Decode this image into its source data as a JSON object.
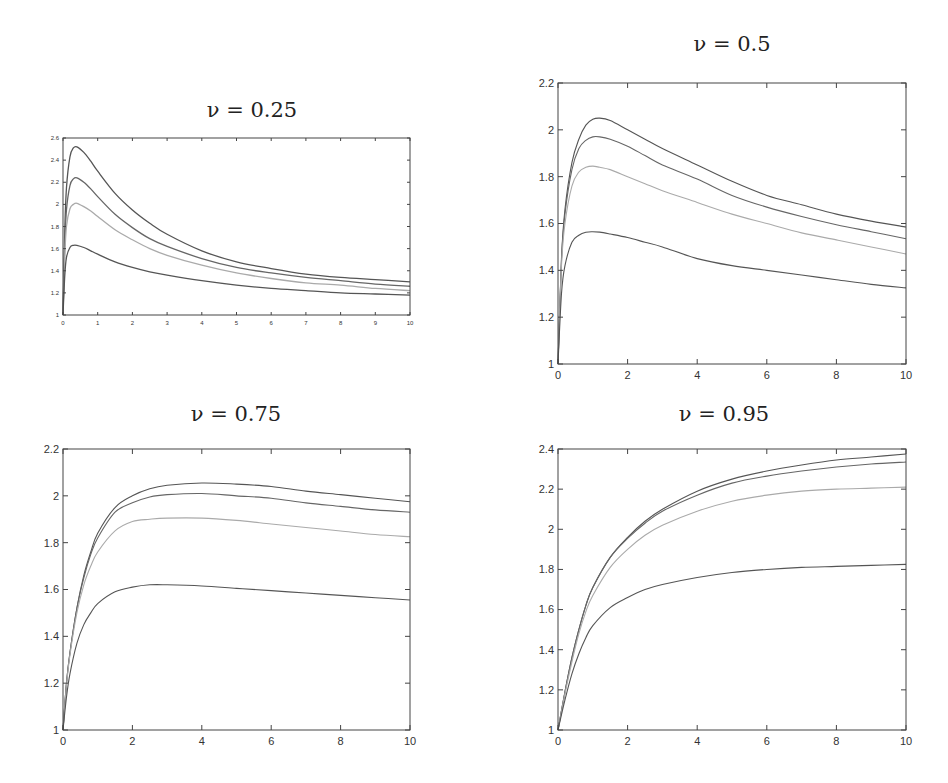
{
  "figure": {
    "background": "#ffffff",
    "axis_color": "#444444",
    "curve_colors": [
      "#555555",
      "#666666",
      "#aaaaaa",
      "#555555"
    ]
  },
  "chart_data": [
    {
      "type": "line",
      "title": "ν = 0.25",
      "title_param": "ν",
      "title_value": "0.25",
      "xlabel": "",
      "ylabel": "",
      "xlim": [
        0,
        10
      ],
      "ylim": [
        1,
        2.6
      ],
      "xticks": [
        0,
        1,
        2,
        3,
        4,
        5,
        6,
        7,
        8,
        9,
        10
      ],
      "yticks": [
        1,
        1.2,
        1.4,
        1.6,
        1.8,
        2,
        2.2,
        2.4,
        2.6
      ],
      "grid": false,
      "legend": null,
      "x": [
        0,
        0.05,
        0.1,
        0.2,
        0.3,
        0.4,
        0.6,
        0.8,
        1,
        1.5,
        2,
        2.5,
        3,
        4,
        5,
        6,
        7,
        8,
        9,
        10
      ],
      "series": [
        {
          "name": "curve 1",
          "values": [
            1.0,
            1.75,
            2.15,
            2.43,
            2.51,
            2.52,
            2.47,
            2.39,
            2.3,
            2.1,
            1.95,
            1.83,
            1.73,
            1.58,
            1.48,
            1.42,
            1.37,
            1.34,
            1.32,
            1.3
          ]
        },
        {
          "name": "curve 2",
          "values": [
            1.0,
            1.62,
            1.95,
            2.17,
            2.23,
            2.24,
            2.2,
            2.14,
            2.07,
            1.91,
            1.79,
            1.69,
            1.62,
            1.51,
            1.43,
            1.38,
            1.34,
            1.31,
            1.28,
            1.26
          ]
        },
        {
          "name": "curve 3",
          "values": [
            1.0,
            1.52,
            1.8,
            1.96,
            2.0,
            2.01,
            1.98,
            1.94,
            1.89,
            1.77,
            1.68,
            1.6,
            1.54,
            1.45,
            1.38,
            1.33,
            1.29,
            1.27,
            1.24,
            1.22
          ]
        },
        {
          "name": "curve 4",
          "values": [
            1.0,
            1.35,
            1.52,
            1.61,
            1.63,
            1.63,
            1.61,
            1.58,
            1.55,
            1.48,
            1.43,
            1.39,
            1.36,
            1.31,
            1.27,
            1.24,
            1.22,
            1.2,
            1.19,
            1.18
          ]
        }
      ]
    },
    {
      "type": "line",
      "title": "ν = 0.5",
      "title_param": "ν",
      "title_value": "0.5",
      "xlabel": "",
      "ylabel": "",
      "xlim": [
        0,
        10
      ],
      "ylim": [
        1,
        2.2
      ],
      "xticks": [
        0,
        2,
        4,
        6,
        8,
        10
      ],
      "yticks": [
        1,
        1.2,
        1.4,
        1.6,
        1.8,
        2,
        2.2
      ],
      "grid": false,
      "legend": null,
      "x": [
        0,
        0.1,
        0.2,
        0.4,
        0.6,
        0.8,
        1,
        1.2,
        1.5,
        2,
        2.5,
        3,
        4,
        5,
        6,
        7,
        8,
        9,
        10
      ],
      "series": [
        {
          "name": "curve 1",
          "values": [
            1.0,
            1.45,
            1.66,
            1.86,
            1.96,
            2.02,
            2.045,
            2.05,
            2.04,
            2.0,
            1.96,
            1.92,
            1.85,
            1.78,
            1.72,
            1.68,
            1.64,
            1.61,
            1.585
          ]
        },
        {
          "name": "curve 2",
          "values": [
            1.0,
            1.44,
            1.64,
            1.83,
            1.92,
            1.955,
            1.97,
            1.97,
            1.96,
            1.93,
            1.89,
            1.85,
            1.79,
            1.72,
            1.67,
            1.63,
            1.595,
            1.565,
            1.535
          ]
        },
        {
          "name": "curve 3",
          "values": [
            1.0,
            1.42,
            1.6,
            1.76,
            1.82,
            1.84,
            1.845,
            1.84,
            1.83,
            1.8,
            1.77,
            1.74,
            1.69,
            1.64,
            1.6,
            1.56,
            1.53,
            1.5,
            1.47
          ]
        },
        {
          "name": "curve 4",
          "values": [
            1.0,
            1.3,
            1.42,
            1.52,
            1.55,
            1.563,
            1.565,
            1.563,
            1.555,
            1.54,
            1.52,
            1.5,
            1.45,
            1.42,
            1.4,
            1.38,
            1.36,
            1.34,
            1.325
          ]
        }
      ]
    },
    {
      "type": "line",
      "title": "ν = 0.75",
      "title_param": "ν",
      "title_value": "0.75",
      "xlabel": "",
      "ylabel": "",
      "xlim": [
        0,
        10
      ],
      "ylim": [
        1,
        2.2
      ],
      "xticks": [
        0,
        2,
        4,
        6,
        8,
        10
      ],
      "yticks": [
        1,
        1.2,
        1.4,
        1.6,
        1.8,
        2,
        2.2
      ],
      "grid": false,
      "legend": null,
      "x": [
        0,
        0.1,
        0.2,
        0.4,
        0.6,
        0.8,
        1,
        1.5,
        2,
        2.5,
        3,
        4,
        5,
        6,
        7,
        8,
        9,
        10
      ],
      "series": [
        {
          "name": "curve 1",
          "values": [
            1.0,
            1.2,
            1.33,
            1.52,
            1.66,
            1.76,
            1.84,
            1.95,
            2.0,
            2.03,
            2.045,
            2.055,
            2.05,
            2.04,
            2.02,
            2.005,
            1.99,
            1.975
          ]
        },
        {
          "name": "curve 2",
          "values": [
            1.0,
            1.2,
            1.33,
            1.52,
            1.65,
            1.75,
            1.82,
            1.93,
            1.97,
            1.995,
            2.005,
            2.01,
            2.0,
            1.99,
            1.97,
            1.955,
            1.94,
            1.93
          ]
        },
        {
          "name": "curve 3",
          "values": [
            1.0,
            1.19,
            1.32,
            1.5,
            1.62,
            1.7,
            1.76,
            1.85,
            1.89,
            1.9,
            1.905,
            1.905,
            1.895,
            1.88,
            1.865,
            1.85,
            1.835,
            1.825
          ]
        },
        {
          "name": "curve 4",
          "values": [
            1.0,
            1.14,
            1.24,
            1.37,
            1.45,
            1.5,
            1.54,
            1.59,
            1.61,
            1.62,
            1.62,
            1.615,
            1.605,
            1.595,
            1.585,
            1.575,
            1.565,
            1.555
          ]
        }
      ]
    },
    {
      "type": "line",
      "title": "ν = 0.95",
      "title_param": "ν",
      "title_value": "0.95",
      "xlabel": "",
      "ylabel": "",
      "xlim": [
        0,
        10
      ],
      "ylim": [
        1,
        2.4
      ],
      "xticks": [
        0,
        2,
        4,
        6,
        8,
        10
      ],
      "yticks": [
        1,
        1.2,
        1.4,
        1.6,
        1.8,
        2,
        2.2,
        2.4
      ],
      "grid": false,
      "legend": null,
      "x": [
        0,
        0.2,
        0.4,
        0.6,
        0.8,
        1,
        1.5,
        2,
        2.5,
        3,
        4,
        5,
        6,
        7,
        8,
        9,
        10
      ],
      "series": [
        {
          "name": "curve 1",
          "values": [
            1.0,
            1.19,
            1.36,
            1.5,
            1.62,
            1.71,
            1.86,
            1.96,
            2.04,
            2.1,
            2.19,
            2.25,
            2.29,
            2.32,
            2.345,
            2.36,
            2.375
          ]
        },
        {
          "name": "curve 2",
          "values": [
            1.0,
            1.19,
            1.36,
            1.5,
            1.62,
            1.71,
            1.86,
            1.955,
            2.03,
            2.09,
            2.17,
            2.23,
            2.265,
            2.29,
            2.31,
            2.325,
            2.335
          ]
        },
        {
          "name": "curve 3",
          "values": [
            1.0,
            1.18,
            1.34,
            1.48,
            1.59,
            1.67,
            1.81,
            1.9,
            1.97,
            2.02,
            2.09,
            2.14,
            2.17,
            2.19,
            2.2,
            2.205,
            2.21
          ]
        },
        {
          "name": "curve 4",
          "values": [
            1.0,
            1.15,
            1.28,
            1.38,
            1.46,
            1.52,
            1.61,
            1.66,
            1.7,
            1.725,
            1.76,
            1.785,
            1.8,
            1.81,
            1.815,
            1.82,
            1.825
          ]
        }
      ]
    }
  ],
  "layout": {
    "panels": [
      {
        "box": [
          63,
          138,
          410,
          315
        ],
        "title_pos": [
          252,
          112
        ],
        "tick_font": 6,
        "tick_len": 3
      },
      {
        "box": [
          558,
          83,
          906,
          364
        ],
        "title_pos": [
          732,
          46
        ],
        "tick_font": 11,
        "tick_len": 5
      },
      {
        "box": [
          63,
          449,
          410,
          730
        ],
        "title_pos": [
          236,
          416
        ],
        "tick_font": 11,
        "tick_len": 5
      },
      {
        "box": [
          558,
          449,
          906,
          730
        ],
        "title_pos": [
          724,
          416
        ],
        "tick_font": 11,
        "tick_len": 5
      }
    ]
  }
}
